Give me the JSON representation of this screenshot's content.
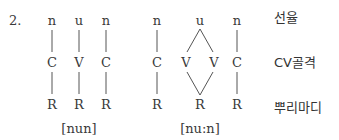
{
  "example_number": "2.",
  "tier_labels": {
    "melody": "선율",
    "skeleton": "CV골격",
    "root": "뿌리마디"
  },
  "left_diagram": {
    "melody": [
      "n",
      "u",
      "n"
    ],
    "skeleton": [
      "C",
      "V",
      "C"
    ],
    "root": [
      "R",
      "R",
      "R"
    ],
    "transcription": "[nun]"
  },
  "right_diagram": {
    "melody": [
      "n",
      "u",
      "n"
    ],
    "skeleton": [
      "C",
      "V",
      "V",
      "C"
    ],
    "root": [
      "R",
      "R",
      "R"
    ],
    "transcription": "[nu:n]"
  }
}
